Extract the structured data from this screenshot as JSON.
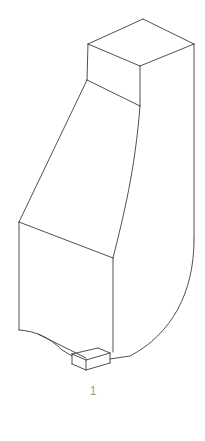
{
  "figure": {
    "domain": "technical-line-drawing",
    "canvas": {
      "width": 205,
      "height": 441,
      "background": "#ffffff"
    },
    "stroke_color": "#3c3c3c",
    "stroke_width": 0.9,
    "label_color": "#9a9a9a",
    "callout": {
      "label": "1",
      "x": 93,
      "y": 392
    },
    "parts": [
      {
        "name": "top-prism-top-face",
        "kind": "polygon",
        "points": "143,19 194,44 140,66 88,44"
      },
      {
        "name": "top-prism-left-face",
        "kind": "polygon",
        "points": "88,44 140,66 140,106 87,80"
      },
      {
        "name": "top-prism-right-face",
        "kind": "polygon",
        "points": "140,66 194,44 194,118 140,106"
      },
      {
        "name": "shoulder-left-face",
        "kind": "polygon",
        "points": "87,80 140,106 113,258 19,222"
      },
      {
        "name": "lower-front-face",
        "kind": "polygon",
        "points": "19,222 113,258 113,352 19,330"
      },
      {
        "name": "foot-top-face",
        "kind": "polygon",
        "points": "72,354 98,348 110,353 86,360"
      },
      {
        "name": "foot-front-face",
        "kind": "polygon",
        "points": "72,354 86,360 86,370 72,364"
      },
      {
        "name": "foot-right-face",
        "kind": "polygon",
        "points": "86,360 110,353 110,363 86,370"
      }
    ],
    "edges": [
      {
        "name": "top-face-back-left-edge",
        "d": "M 88,44 L 143,19"
      },
      {
        "name": "top-face-back-right-edge",
        "d": "M 143,19 L 194,44"
      },
      {
        "name": "top-face-front-right-edge",
        "d": "M 194,44 L 140,66"
      },
      {
        "name": "top-face-front-left-edge",
        "d": "M 140,66 L 88,44"
      },
      {
        "name": "top-prism-left-vertical-edge",
        "d": "M 88,44 L 87,80"
      },
      {
        "name": "top-prism-center-vertical-edge",
        "d": "M 140,66 L 140,106"
      },
      {
        "name": "top-prism-right-vertical-edge",
        "d": "M 194,44 L 194,240"
      },
      {
        "name": "shoulder-bevel-edge",
        "d": "M 87,80 L 140,106"
      },
      {
        "name": "body-left-taper-edge",
        "d": "M 87,80 L 19,222"
      },
      {
        "name": "body-right-curved-edge",
        "d": "M 140,106 C 135,170 124,214 113,258"
      },
      {
        "name": "lower-box-top-edge",
        "d": "M 19,222 L 113,258"
      },
      {
        "name": "lower-box-left-vertical-edge",
        "d": "M 19,222 L 19,330"
      },
      {
        "name": "lower-box-center-vertical-edge",
        "d": "M 113,258 L 113,352"
      },
      {
        "name": "outer-curve-right-profile",
        "d": "M 194,240 C 194,292 172,334 130,356 L 110,359"
      },
      {
        "name": "bottom-left-fillet-edge",
        "d": "M 19,330 C 36,331 50,338 62,350 L 72,356"
      },
      {
        "name": "bottom-taper-edge",
        "d": "M 38,334 L 86,358"
      },
      {
        "name": "foot-top-back-edge",
        "d": "M 72,354 L 98,348"
      },
      {
        "name": "foot-top-right-edge",
        "d": "M 98,348 L 110,353"
      },
      {
        "name": "foot-top-front-right-edge",
        "d": "M 110,353 L 86,360"
      },
      {
        "name": "foot-top-front-left-edge",
        "d": "M 86,360 L 72,354"
      },
      {
        "name": "foot-left-vertical-edge",
        "d": "M 72,354 L 72,364"
      },
      {
        "name": "foot-center-vertical-edge",
        "d": "M 86,360 L 86,370"
      },
      {
        "name": "foot-right-vertical-edge",
        "d": "M 110,353 L 110,363"
      },
      {
        "name": "foot-bottom-left-edge",
        "d": "M 72,364 L 86,370"
      },
      {
        "name": "foot-bottom-right-edge",
        "d": "M 86,370 L 110,363"
      }
    ]
  }
}
